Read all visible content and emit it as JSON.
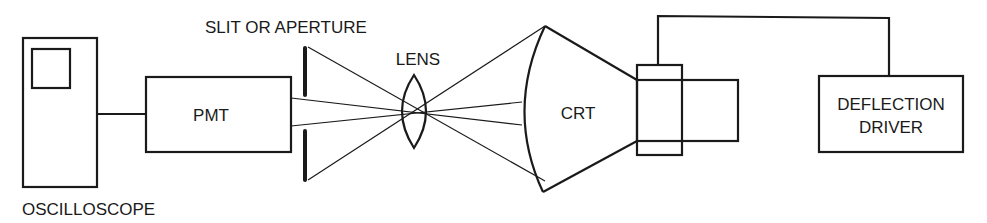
{
  "diagram": {
    "type": "optical block diagram",
    "colors": {
      "stroke": "#1a1a1a",
      "background": "#ffffff"
    },
    "components": {
      "oscilloscope": {
        "label": "OSCILLOSCOPE"
      },
      "pmt": {
        "label": "PMT"
      },
      "slit": {
        "label": "SLIT OR APERTURE"
      },
      "lens": {
        "label": "LENS"
      },
      "crt": {
        "label": "CRT"
      },
      "deflection_driver": {
        "label_line1": "DEFLECTION",
        "label_line2": "DRIVER"
      }
    },
    "connections": [
      {
        "from": "oscilloscope",
        "to": "pmt",
        "kind": "wire"
      },
      {
        "from": "pmt",
        "to": "crt",
        "kind": "light rays via slit and lens"
      },
      {
        "from": "deflection_driver",
        "to": "crt yoke",
        "kind": "wire"
      }
    ]
  }
}
